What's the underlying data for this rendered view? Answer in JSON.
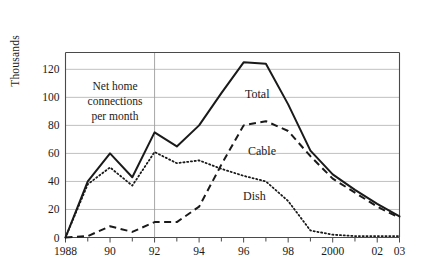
{
  "chart_data": {
    "type": "line",
    "title": "",
    "subtitle": "",
    "ylabel": "Thousands",
    "xlabel": "",
    "annotation": {
      "line1": "Net home",
      "line2": "connections",
      "line3": "per month"
    },
    "grid": true,
    "legend_position": "inline-labels",
    "x": [
      1988,
      1989,
      1990,
      1991,
      1992,
      1993,
      1994,
      1995,
      1996,
      1997,
      1998,
      1999,
      2000,
      2001,
      2002,
      2003
    ],
    "xtick_labels": [
      "1988",
      "",
      "90",
      "",
      "92",
      "",
      "94",
      "",
      "96",
      "",
      "98",
      "",
      "2000",
      "",
      "02",
      "03"
    ],
    "xlim": [
      1988,
      2003
    ],
    "ytick_values": [
      0,
      20,
      40,
      60,
      80,
      100,
      120
    ],
    "ytick_labels": [
      "0",
      "20",
      "40",
      "60",
      "80",
      "100",
      "120"
    ],
    "ylim": [
      0,
      132
    ],
    "vertical_marker_year": 1992,
    "series": [
      {
        "name": "Total",
        "style": "solid",
        "label": "Total",
        "values": [
          0,
          40,
          60,
          43,
          75,
          65,
          80,
          103,
          125,
          124,
          95,
          62,
          45,
          34,
          24,
          15
        ]
      },
      {
        "name": "Cable",
        "style": "dashed",
        "label": "Cable",
        "values": [
          0,
          1,
          8,
          4,
          11,
          11,
          22,
          52,
          80,
          83,
          76,
          58,
          42,
          32,
          22,
          14
        ]
      },
      {
        "name": "Dish",
        "style": "dotted",
        "label": "Dish",
        "values": [
          0,
          38,
          50,
          37,
          61,
          53,
          55,
          49,
          44,
          40,
          26,
          5,
          2,
          1,
          1,
          1
        ]
      }
    ]
  }
}
